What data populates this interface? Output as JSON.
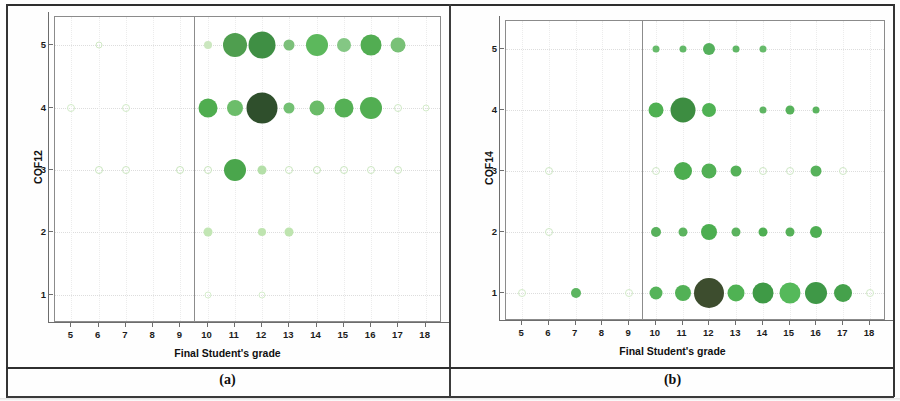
{
  "figure": {
    "caption_a": "(a)",
    "caption_b": "(b)"
  },
  "chart_data": [
    {
      "panel": "a",
      "type": "scatter",
      "title": "",
      "xlabel": "Final Student's grade",
      "ylabel": "COF12",
      "xticks": [
        5,
        6,
        7,
        8,
        9,
        10,
        11,
        12,
        13,
        14,
        15,
        16,
        17,
        18
      ],
      "yticks": [
        1,
        2,
        3,
        4,
        5
      ],
      "xlim": [
        4.4,
        18.6
      ],
      "ylim": [
        0.55,
        5.45
      ],
      "grid": true,
      "legend": "none",
      "reference_line_x": 9.5,
      "size_encodes": "count",
      "points": [
        {
          "x": 6,
          "y": 5,
          "size": 5,
          "color": "#cfe8c4"
        },
        {
          "x": 10,
          "y": 5,
          "size": 8,
          "color": "#cbe7bf"
        },
        {
          "x": 11,
          "y": 5,
          "size": 24,
          "color": "#4f9e4f"
        },
        {
          "x": 12,
          "y": 5,
          "size": 27,
          "color": "#3f8f44"
        },
        {
          "x": 13,
          "y": 5,
          "size": 11,
          "color": "#7cc07a"
        },
        {
          "x": 14,
          "y": 5,
          "size": 22,
          "color": "#5cb85c"
        },
        {
          "x": 15,
          "y": 5,
          "size": 14,
          "color": "#84c784"
        },
        {
          "x": 16,
          "y": 5,
          "size": 21,
          "color": "#52ad52"
        },
        {
          "x": 17,
          "y": 5,
          "size": 15,
          "color": "#79c177"
        },
        {
          "x": 5,
          "y": 4,
          "size": 6,
          "color": "#d2ebc8"
        },
        {
          "x": 7,
          "y": 4,
          "size": 6,
          "color": "#d2ebc8"
        },
        {
          "x": 10,
          "y": 4,
          "size": 19,
          "color": "#4fad4f"
        },
        {
          "x": 11,
          "y": 4,
          "size": 16,
          "color": "#6cbd6a"
        },
        {
          "x": 12,
          "y": 4,
          "size": 31,
          "color": "#2f4f2c"
        },
        {
          "x": 13,
          "y": 4,
          "size": 11,
          "color": "#73c073"
        },
        {
          "x": 14,
          "y": 4,
          "size": 15,
          "color": "#6abb68"
        },
        {
          "x": 15,
          "y": 4,
          "size": 19,
          "color": "#55b055"
        },
        {
          "x": 16,
          "y": 4,
          "size": 22,
          "color": "#52ae52"
        },
        {
          "x": 17,
          "y": 4,
          "size": 6,
          "color": "#cfe9c5"
        },
        {
          "x": 18,
          "y": 4,
          "size": 5,
          "color": "#d4ecca"
        },
        {
          "x": 6,
          "y": 3,
          "size": 6,
          "color": "#cae6bf"
        },
        {
          "x": 7,
          "y": 3,
          "size": 6,
          "color": "#cde7c2"
        },
        {
          "x": 9,
          "y": 3,
          "size": 6,
          "color": "#c9e5bd"
        },
        {
          "x": 10,
          "y": 3,
          "size": 6,
          "color": "#c9e5bd"
        },
        {
          "x": 11,
          "y": 3,
          "size": 22,
          "color": "#4aa64c"
        },
        {
          "x": 12,
          "y": 3,
          "size": 9,
          "color": "#b4dfa8"
        },
        {
          "x": 13,
          "y": 3,
          "size": 6,
          "color": "#cae6be"
        },
        {
          "x": 14,
          "y": 3,
          "size": 6,
          "color": "#c6e4ba"
        },
        {
          "x": 15,
          "y": 3,
          "size": 6,
          "color": "#cae6bf"
        },
        {
          "x": 16,
          "y": 3,
          "size": 6,
          "color": "#cde7c2"
        },
        {
          "x": 17,
          "y": 3,
          "size": 6,
          "color": "#cbe6c0"
        },
        {
          "x": 10,
          "y": 2,
          "size": 9,
          "color": "#c2e6b4"
        },
        {
          "x": 12,
          "y": 2,
          "size": 8,
          "color": "#bfe4b0"
        },
        {
          "x": 13,
          "y": 2,
          "size": 9,
          "color": "#bee4af"
        },
        {
          "x": 10,
          "y": 1,
          "size": 5,
          "color": "#d6eecd"
        },
        {
          "x": 12,
          "y": 1,
          "size": 5,
          "color": "#d6eecd"
        }
      ]
    },
    {
      "panel": "b",
      "type": "scatter",
      "title": "",
      "xlabel": "Final Student's grade",
      "ylabel": "COF14",
      "xticks": [
        5,
        6,
        7,
        8,
        9,
        10,
        11,
        12,
        13,
        14,
        15,
        16,
        17,
        18
      ],
      "yticks": [
        1,
        2,
        3,
        4,
        5
      ],
      "xlim": [
        4.4,
        18.6
      ],
      "ylim": [
        0.55,
        5.45
      ],
      "grid": true,
      "legend": "none",
      "reference_line_x": 9.5,
      "size_encodes": "count",
      "points": [
        {
          "x": 10,
          "y": 5,
          "size": 7,
          "color": "#67bb6b"
        },
        {
          "x": 11,
          "y": 5,
          "size": 7,
          "color": "#63b968"
        },
        {
          "x": 12,
          "y": 5,
          "size": 12,
          "color": "#55b05c"
        },
        {
          "x": 13,
          "y": 5,
          "size": 7,
          "color": "#60b766"
        },
        {
          "x": 14,
          "y": 5,
          "size": 7,
          "color": "#67bb6b"
        },
        {
          "x": 10,
          "y": 4,
          "size": 15,
          "color": "#4fb052"
        },
        {
          "x": 11,
          "y": 4,
          "size": 25,
          "color": "#3d8d41"
        },
        {
          "x": 12,
          "y": 4,
          "size": 14,
          "color": "#50b254"
        },
        {
          "x": 14,
          "y": 4,
          "size": 7,
          "color": "#5fb563"
        },
        {
          "x": 15,
          "y": 4,
          "size": 9,
          "color": "#57b25b"
        },
        {
          "x": 16,
          "y": 4,
          "size": 7,
          "color": "#5bb45f"
        },
        {
          "x": 6,
          "y": 3,
          "size": 6,
          "color": "#cfe8c6"
        },
        {
          "x": 10,
          "y": 3,
          "size": 6,
          "color": "#cfe8c6"
        },
        {
          "x": 11,
          "y": 3,
          "size": 18,
          "color": "#4dad50"
        },
        {
          "x": 12,
          "y": 3,
          "size": 15,
          "color": "#52b055"
        },
        {
          "x": 13,
          "y": 3,
          "size": 11,
          "color": "#55b158"
        },
        {
          "x": 14,
          "y": 3,
          "size": 6,
          "color": "#cde7c3"
        },
        {
          "x": 15,
          "y": 3,
          "size": 6,
          "color": "#cfe8c6"
        },
        {
          "x": 16,
          "y": 3,
          "size": 11,
          "color": "#57b25b"
        },
        {
          "x": 17,
          "y": 3,
          "size": 6,
          "color": "#cfe8c6"
        },
        {
          "x": 6,
          "y": 2,
          "size": 6,
          "color": "#cfe8c6"
        },
        {
          "x": 10,
          "y": 2,
          "size": 10,
          "color": "#58b15c"
        },
        {
          "x": 11,
          "y": 2,
          "size": 9,
          "color": "#5cb45f"
        },
        {
          "x": 12,
          "y": 2,
          "size": 16,
          "color": "#4cae50"
        },
        {
          "x": 13,
          "y": 2,
          "size": 9,
          "color": "#5bb35e"
        },
        {
          "x": 14,
          "y": 2,
          "size": 9,
          "color": "#4faf53"
        },
        {
          "x": 15,
          "y": 2,
          "size": 9,
          "color": "#56b159"
        },
        {
          "x": 16,
          "y": 2,
          "size": 12,
          "color": "#4fae53"
        },
        {
          "x": 5,
          "y": 1,
          "size": 6,
          "color": "#d3ebc9"
        },
        {
          "x": 7,
          "y": 1,
          "size": 10,
          "color": "#5db561"
        },
        {
          "x": 9,
          "y": 1,
          "size": 6,
          "color": "#d3ebc9"
        },
        {
          "x": 10,
          "y": 1,
          "size": 13,
          "color": "#56b45a"
        },
        {
          "x": 11,
          "y": 1,
          "size": 16,
          "color": "#52b156"
        },
        {
          "x": 12,
          "y": 1,
          "size": 30,
          "color": "#3d4d2e"
        },
        {
          "x": 13,
          "y": 1,
          "size": 17,
          "color": "#4fb253"
        },
        {
          "x": 14,
          "y": 1,
          "size": 21,
          "color": "#3f9a46"
        },
        {
          "x": 15,
          "y": 1,
          "size": 21,
          "color": "#55b95a"
        },
        {
          "x": 16,
          "y": 1,
          "size": 22,
          "color": "#3f9847"
        },
        {
          "x": 17,
          "y": 1,
          "size": 18,
          "color": "#45a14b"
        },
        {
          "x": 18,
          "y": 1,
          "size": 6,
          "color": "#d3ebc9"
        }
      ]
    }
  ]
}
